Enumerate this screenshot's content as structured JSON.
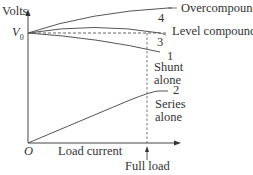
{
  "diagram": {
    "y_axis_label": "Volts",
    "x_axis_label": "Load current",
    "origin_label": "O",
    "v0_label": "V",
    "v0_subscript": "0",
    "full_load_label": "Full load",
    "curves": [
      {
        "id": "4",
        "number": "4",
        "label": "Overcompound"
      },
      {
        "id": "3",
        "number": "3",
        "label": "Level compound"
      },
      {
        "id": "1",
        "number": "1",
        "label_line1": "Shunt",
        "label_line2": "alone"
      },
      {
        "id": "2",
        "number": "2",
        "label_line1": "Series",
        "label_line2": "alone"
      }
    ],
    "colors": {
      "line": "#555555",
      "text": "#333333"
    }
  }
}
